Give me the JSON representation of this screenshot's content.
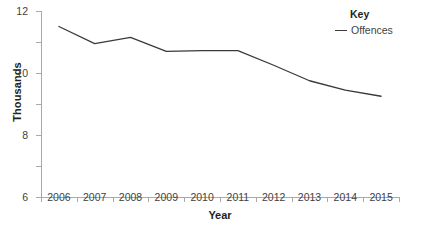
{
  "chart_data": {
    "type": "line",
    "title": "",
    "xlabel": "Year",
    "ylabel": "Thousands",
    "categories": [
      "2006",
      "2007",
      "2008",
      "2009",
      "2010",
      "2011",
      "2012",
      "2013",
      "2014",
      "2015"
    ],
    "series": [
      {
        "name": "Offences",
        "color": "#3a3a3a",
        "values": [
          11.0,
          9.9,
          10.3,
          9.4,
          9.45,
          9.45,
          8.5,
          7.5,
          6.9,
          6.5
        ]
      }
    ],
    "ylim": [
      0,
      12
    ],
    "yticks": [
      0,
      2,
      4,
      6,
      8,
      10,
      12
    ],
    "ytick_labels": [
      "0",
      "2",
      "4",
      "6",
      "8",
      "10",
      "12"
    ],
    "grid": false,
    "legend_position": "top-right"
  },
  "legend": {
    "title": "Key",
    "entries": [
      {
        "label": "Offences"
      }
    ]
  },
  "axes": {
    "x_title": "Year",
    "y_title": "Thousands"
  },
  "colors": {
    "series": "#3a3a3a",
    "axis": "#a9a9a9",
    "text": "#231f20",
    "tick_text": "#3f3f3f",
    "background": "#ffffff"
  }
}
